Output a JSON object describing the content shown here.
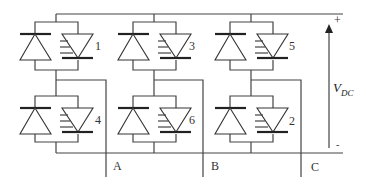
{
  "diagram": {
    "type": "three-phase inverter circuit",
    "switches": [
      {
        "id": "1",
        "position": "upper",
        "leg": "A"
      },
      {
        "id": "4",
        "position": "lower",
        "leg": "A"
      },
      {
        "id": "3",
        "position": "upper",
        "leg": "B"
      },
      {
        "id": "6",
        "position": "lower",
        "leg": "B"
      },
      {
        "id": "5",
        "position": "upper",
        "leg": "C"
      },
      {
        "id": "2",
        "position": "lower",
        "leg": "C"
      }
    ],
    "outputs": [
      "A",
      "B",
      "C"
    ],
    "supply": {
      "label": "V",
      "subscript": "DC",
      "plus": "+",
      "minus": "-"
    },
    "line_color": "#444444"
  }
}
